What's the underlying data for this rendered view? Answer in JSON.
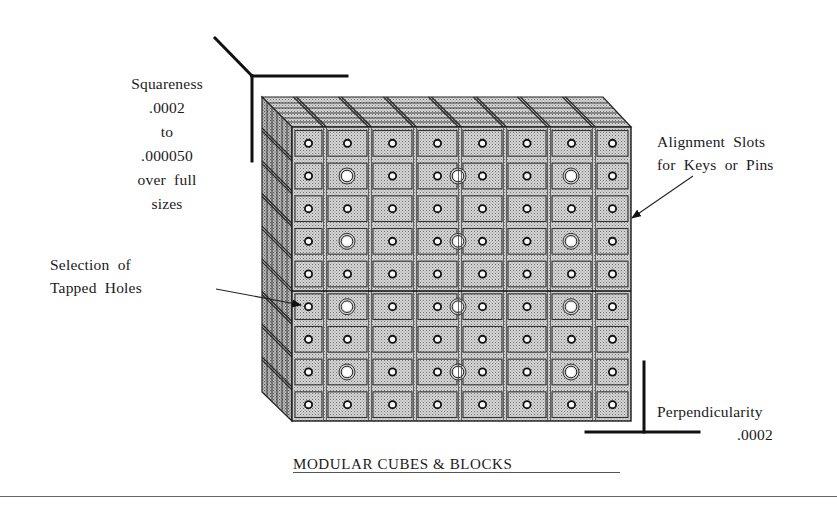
{
  "figure": {
    "caption": "MODULAR CUBES & BLOCKS",
    "annotations": {
      "squareness": {
        "lines": [
          "Squareness",
          ".0002",
          "to",
          ".000050",
          "over  full",
          "sizes"
        ]
      },
      "alignment_slots": {
        "lines": [
          "Alignment  Slots",
          "for  Keys  or  Pins"
        ]
      },
      "tapped_holes": {
        "lines": [
          "Selection  of",
          "Tapped  Holes"
        ]
      },
      "perpendicularity": {
        "label": "Perpendicularity",
        "value": ".0002"
      }
    },
    "block": {
      "columns": 8,
      "rows": 9,
      "large_hole_rows": [
        2,
        4,
        6,
        8
      ],
      "large_hole_columns_x": [
        347,
        458,
        571
      ]
    },
    "colors": {
      "ink": "#1a1a1a",
      "face_fill": "#c9c9c9",
      "side_fill": "#b5b5b5",
      "top_fill": "#d2d2d2",
      "background": "#ffffff"
    }
  }
}
